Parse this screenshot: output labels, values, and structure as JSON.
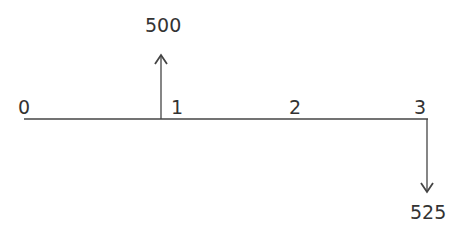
{
  "diagram": {
    "type": "cash-flow-timeline",
    "periods": [
      "0",
      "1",
      "2",
      "3"
    ],
    "cash_flows": [
      {
        "period": "1",
        "amount": "500",
        "direction": "up"
      },
      {
        "period": "3",
        "amount": "525",
        "direction": "down"
      }
    ]
  },
  "colors": {
    "line": "#444444",
    "text": "#333333"
  }
}
